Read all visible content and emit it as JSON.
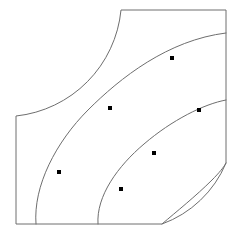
{
  "figure": {
    "type": "geometric-diagram",
    "canvas": {
      "width": 238,
      "height": 239,
      "background": "#ffffff"
    },
    "stroke_color": "#6e6e6e",
    "marker_color": "#000000",
    "stroke_width": 1
  },
  "boundary": {
    "name": "region-outline",
    "path": "M 16 116 L 16 224 L 162 224 A 110 110 0 0 0 226 163 L 226 10 L 121 10 A 118 118 0 0 1 16 116 Z",
    "vertices": [
      {
        "name": "left-top",
        "x": 16,
        "y": 116
      },
      {
        "name": "left-bottom",
        "x": 16,
        "y": 224
      },
      {
        "name": "bottom-right-arc-start",
        "x": 162,
        "y": 224
      },
      {
        "name": "right-bottom",
        "x": 226,
        "y": 163
      },
      {
        "name": "right-top",
        "x": 226,
        "y": 10
      },
      {
        "name": "top-left-arc-start",
        "x": 121,
        "y": 10
      }
    ],
    "arcs": [
      {
        "name": "top-left-concave-arc",
        "from": {
          "x": 16,
          "y": 116
        },
        "to": {
          "x": 121,
          "y": 10
        },
        "radius": 118,
        "sweep": "concave-inward"
      },
      {
        "name": "bottom-right-convex-arc",
        "from": {
          "x": 162,
          "y": 224
        },
        "to": {
          "x": 226,
          "y": 163
        },
        "radius": 110,
        "sweep": "convex-inward"
      }
    ]
  },
  "curves": [
    {
      "name": "interior-curve-1",
      "path": "M 36 224 C 33 186 56 142 88 110 C 120 78 168 40 226 33",
      "start": {
        "x": 36,
        "y": 224
      },
      "end": {
        "x": 226,
        "y": 33
      }
    },
    {
      "name": "interior-curve-2",
      "path": "M 98 224 C 96 196 118 166 144 144 C 172 120 204 104 226 100",
      "start": {
        "x": 98,
        "y": 224
      },
      "end": {
        "x": 226,
        "y": 100
      }
    },
    {
      "name": "boundary-curve-3",
      "path": "M 162 224 C 176 212 196 196 212 180 C 219 173 224 167 226 163",
      "start": {
        "x": 162,
        "y": 224
      },
      "end": {
        "x": 226,
        "y": 163
      }
    }
  ],
  "nodes": [
    {
      "name": "node-1",
      "x": 59,
      "y": 172,
      "curve": "interior-curve-1",
      "size": 4
    },
    {
      "name": "node-2",
      "x": 110,
      "y": 108,
      "curve": "interior-curve-1",
      "size": 4
    },
    {
      "name": "node-3",
      "x": 172,
      "y": 58,
      "curve": "interior-curve-1",
      "size": 4
    },
    {
      "name": "node-4",
      "x": 121,
      "y": 189,
      "curve": "interior-curve-2",
      "size": 4
    },
    {
      "name": "node-5",
      "x": 154,
      "y": 153,
      "curve": "interior-curve-2",
      "size": 4
    },
    {
      "name": "node-6",
      "x": 199,
      "y": 110,
      "curve": "interior-curve-2",
      "size": 4
    }
  ]
}
